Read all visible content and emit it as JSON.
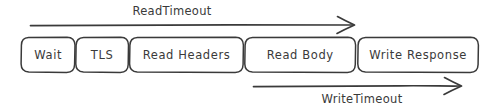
{
  "diagram": {
    "stroke_color": "#3a3a3a",
    "background_color": "#ffffff",
    "stages": [
      {
        "label": "Wait"
      },
      {
        "label": "TLS"
      },
      {
        "label": "Read Headers"
      },
      {
        "label": "Read Body"
      },
      {
        "label": "Write Response"
      }
    ],
    "arrows": [
      {
        "label": "ReadTimeout",
        "direction": "right",
        "position": "above"
      },
      {
        "label": "WriteTimeout",
        "direction": "right",
        "position": "below"
      }
    ]
  }
}
